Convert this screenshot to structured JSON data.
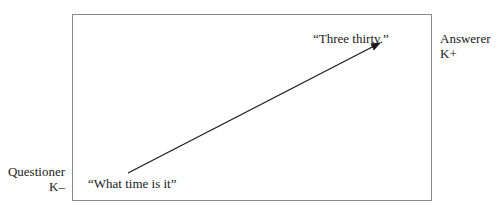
{
  "diagram": {
    "questioner": {
      "role": "Questioner",
      "knowledge": "K–"
    },
    "answerer": {
      "role": "Answerer",
      "knowledge": "K+"
    },
    "question_utterance": "“What time is it”",
    "answer_utterance": "“Three thirty.”",
    "arrow": {
      "from": "question_utterance",
      "to": "answer_utterance",
      "direction": "up-right"
    }
  }
}
